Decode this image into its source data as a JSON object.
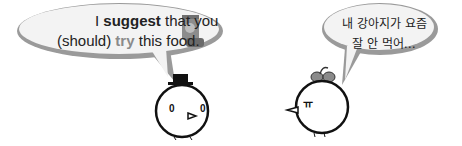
{
  "bubble_left": {
    "line1": {
      "pre": "I ",
      "bold": "suggest",
      "post": " that you"
    },
    "line2": {
      "pre": "(should) ",
      "gray": "try",
      "post": " this food."
    },
    "icon": "dog-food-bag-icon"
  },
  "bubble_right": {
    "line1": "내 강아지가 요즘",
    "line2": "잘 안 먹어…"
  },
  "characters": {
    "left": {
      "accessory": "top-hat",
      "eyes": "0 0"
    },
    "right": {
      "accessory": "bow",
      "eyes": "ㅠ"
    }
  },
  "colors": {
    "bubble_fill": "#f4f4f4",
    "bubble_shadow": "#9a9a9a",
    "outline": "#111111"
  }
}
